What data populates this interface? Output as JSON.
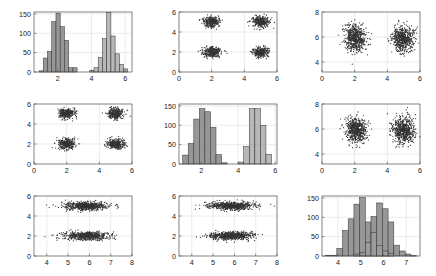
{
  "figure": {
    "name": "scatter-plot-matrix",
    "rows": 3,
    "cols": 3,
    "background": "#ffffff",
    "point_color": "#333333",
    "bar_fill_a": "#8e8e8e",
    "bar_fill_b": "#9c9c9c",
    "bar_edge": "#3c3c3c",
    "grid_color": "#d9d9d9",
    "axis_color": "#4d4d4d"
  },
  "chart_data": [
    {
      "id": "panel-1-1",
      "type": "bar",
      "subtype": "histogram",
      "title": "",
      "xlabel": "",
      "ylabel": "",
      "xlim": [
        0.6,
        6.4
      ],
      "ylim": [
        0,
        155
      ],
      "xticks": [
        2,
        4,
        6
      ],
      "xtick_labels": [
        "2",
        "4",
        "6"
      ],
      "yticks": [
        0,
        50,
        100,
        150
      ],
      "ytick_labels": [
        "0",
        "50",
        "100",
        "150"
      ],
      "grid": true,
      "bin_width": 0.25,
      "series": [
        {
          "name": "group-1",
          "bin_starts": [
            0.9,
            1.15,
            1.4,
            1.65,
            1.9,
            2.15,
            2.4,
            2.65,
            2.9
          ],
          "values": [
            3,
            36,
            53,
            130,
            152,
            117,
            82,
            11,
            11
          ]
        },
        {
          "name": "group-2",
          "bin_starts": [
            3.9,
            4.15,
            4.4,
            4.65,
            4.9,
            5.15,
            5.4,
            5.65,
            5.9
          ],
          "values": [
            4,
            11,
            37,
            86,
            154,
            93,
            47,
            20,
            8
          ]
        }
      ]
    },
    {
      "id": "panel-1-2",
      "type": "scatter",
      "title": "",
      "xlabel": "",
      "ylabel": "",
      "xlim": [
        0,
        6
      ],
      "ylim": [
        0,
        6
      ],
      "xticks": [
        0,
        2,
        4,
        6
      ],
      "xtick_labels": [
        "0",
        "2",
        "4",
        "6"
      ],
      "yticks": [
        0,
        2,
        4,
        6
      ],
      "ytick_labels": [
        "0",
        "2",
        "4",
        "6"
      ],
      "grid": true,
      "clusters": [
        {
          "name": "cluster-a",
          "cx": 2.0,
          "cy": 5.05,
          "sx": 0.26,
          "sy": 0.26,
          "n": 300
        },
        {
          "name": "cluster-b",
          "cx": 5.0,
          "cy": 5.05,
          "sx": 0.26,
          "sy": 0.26,
          "n": 300
        },
        {
          "name": "cluster-c",
          "cx": 2.0,
          "cy": 2.0,
          "sx": 0.26,
          "sy": 0.26,
          "n": 300
        },
        {
          "name": "cluster-d",
          "cx": 5.0,
          "cy": 2.0,
          "sx": 0.26,
          "sy": 0.26,
          "n": 300
        }
      ]
    },
    {
      "id": "panel-1-3",
      "type": "scatter",
      "title": "",
      "xlabel": "",
      "ylabel": "",
      "xlim": [
        0,
        6
      ],
      "ylim": [
        3.2,
        8
      ],
      "xticks": [
        0,
        2,
        4,
        6
      ],
      "xtick_labels": [
        "0",
        "2",
        "4",
        "6"
      ],
      "yticks": [
        4,
        6,
        8
      ],
      "ytick_labels": [
        "4",
        "6",
        "8"
      ],
      "grid": true,
      "clusters": [
        {
          "name": "cluster-left",
          "cx": 2.05,
          "cy": 5.92,
          "sx": 0.33,
          "sy": 0.52,
          "n": 600
        },
        {
          "name": "cluster-right",
          "cx": 4.95,
          "cy": 5.85,
          "sx": 0.33,
          "sy": 0.52,
          "n": 600
        }
      ]
    },
    {
      "id": "panel-2-1",
      "type": "scatter",
      "title": "",
      "xlabel": "",
      "ylabel": "",
      "xlim": [
        0,
        6
      ],
      "ylim": [
        0,
        6
      ],
      "xticks": [
        0,
        2,
        4,
        6
      ],
      "xtick_labels": [
        "0",
        "2",
        "4",
        "6"
      ],
      "yticks": [
        0,
        2,
        4,
        6
      ],
      "ytick_labels": [
        "0",
        "2",
        "4",
        "6"
      ],
      "grid": true,
      "clusters": [
        {
          "name": "cluster-a",
          "cx": 2.0,
          "cy": 5.05,
          "sx": 0.26,
          "sy": 0.26,
          "n": 300
        },
        {
          "name": "cluster-b",
          "cx": 5.0,
          "cy": 5.05,
          "sx": 0.26,
          "sy": 0.26,
          "n": 300
        },
        {
          "name": "cluster-c",
          "cx": 2.0,
          "cy": 2.0,
          "sx": 0.26,
          "sy": 0.26,
          "n": 300
        },
        {
          "name": "cluster-d",
          "cx": 5.0,
          "cy": 2.0,
          "sx": 0.26,
          "sy": 0.26,
          "n": 300
        }
      ]
    },
    {
      "id": "panel-2-2",
      "type": "bar",
      "subtype": "histogram",
      "title": "",
      "xlabel": "",
      "ylabel": "",
      "xlim": [
        0.8,
        6.1
      ],
      "ylim": [
        0,
        155
      ],
      "xticks": [
        2,
        4,
        6
      ],
      "xtick_labels": [
        "2",
        "4",
        "6"
      ],
      "yticks": [
        0,
        50,
        100,
        150
      ],
      "ytick_labels": [
        "0",
        "50",
        "100",
        "150"
      ],
      "grid": true,
      "bin_width": 0.3,
      "series": [
        {
          "name": "group-1",
          "bin_starts": [
            1.0,
            1.3,
            1.6,
            1.9,
            2.2,
            2.5,
            2.8,
            3.1
          ],
          "values": [
            23,
            53,
            116,
            143,
            135,
            95,
            24,
            3
          ]
        },
        {
          "name": "group-2",
          "bin_starts": [
            4.0,
            4.3,
            4.6,
            4.9,
            5.2,
            5.5
          ],
          "values": [
            5,
            45,
            143,
            143,
            100,
            25
          ]
        }
      ]
    },
    {
      "id": "panel-2-3",
      "type": "scatter",
      "title": "",
      "xlabel": "",
      "ylabel": "",
      "xlim": [
        0,
        6
      ],
      "ylim": [
        3.2,
        8
      ],
      "xticks": [
        0,
        2,
        4,
        6
      ],
      "xtick_labels": [
        "0",
        "2",
        "4",
        "6"
      ],
      "yticks": [
        4,
        6,
        8
      ],
      "ytick_labels": [
        "4",
        "6",
        "8"
      ],
      "grid": true,
      "clusters": [
        {
          "name": "cluster-left",
          "cx": 2.1,
          "cy": 5.9,
          "sx": 0.33,
          "sy": 0.52,
          "n": 600
        },
        {
          "name": "cluster-right",
          "cx": 5.0,
          "cy": 5.9,
          "sx": 0.33,
          "sy": 0.52,
          "n": 600
        }
      ]
    },
    {
      "id": "panel-3-1",
      "type": "scatter",
      "title": "",
      "xlabel": "",
      "ylabel": "",
      "xlim": [
        3.4,
        8
      ],
      "ylim": [
        0,
        6
      ],
      "xticks": [
        4,
        5,
        6,
        7,
        8
      ],
      "xtick_labels": [
        "4",
        "5",
        "6",
        "7",
        "8"
      ],
      "yticks": [
        0,
        2,
        4,
        6
      ],
      "ytick_labels": [
        "0",
        "2",
        "4",
        "6"
      ],
      "grid": true,
      "clusters": [
        {
          "name": "cluster-top",
          "cx": 5.85,
          "cy": 5.02,
          "sx": 0.53,
          "sy": 0.2,
          "n": 600
        },
        {
          "name": "cluster-bottom",
          "cx": 5.85,
          "cy": 2.02,
          "sx": 0.53,
          "sy": 0.2,
          "n": 600
        }
      ]
    },
    {
      "id": "panel-3-2",
      "type": "scatter",
      "title": "",
      "xlabel": "",
      "ylabel": "",
      "xlim": [
        3.4,
        8
      ],
      "ylim": [
        0,
        6
      ],
      "xticks": [
        4,
        5,
        6,
        7,
        8
      ],
      "xtick_labels": [
        "4",
        "5",
        "6",
        "7",
        "8"
      ],
      "yticks": [
        0,
        2,
        4,
        6
      ],
      "ytick_labels": [
        "0",
        "2",
        "4",
        "6"
      ],
      "grid": true,
      "clusters": [
        {
          "name": "cluster-top",
          "cx": 5.85,
          "cy": 5.02,
          "sx": 0.53,
          "sy": 0.2,
          "n": 600
        },
        {
          "name": "cluster-bottom",
          "cx": 5.85,
          "cy": 2.02,
          "sx": 0.53,
          "sy": 0.2,
          "n": 600
        }
      ]
    },
    {
      "id": "panel-3-3",
      "type": "bar",
      "subtype": "histogram",
      "title": "",
      "xlabel": "",
      "ylabel": "",
      "xlim": [
        3.3,
        7.6
      ],
      "ylim": [
        0,
        155
      ],
      "xticks": [
        4,
        5,
        6,
        7
      ],
      "xtick_labels": [
        "4",
        "5",
        "6",
        "7"
      ],
      "yticks": [
        0,
        50,
        100,
        150
      ],
      "ytick_labels": [
        "0",
        "50",
        "100",
        "150"
      ],
      "grid": true,
      "bin_width": 0.25,
      "series": [
        {
          "name": "group-1",
          "bin_starts": [
            3.45,
            3.7,
            3.95,
            4.2,
            4.45,
            4.7,
            4.95,
            5.2,
            5.45,
            5.7,
            5.95,
            6.2,
            6.45,
            6.7,
            6.95,
            7.2
          ],
          "values": [
            2,
            2,
            20,
            66,
            96,
            134,
            151,
            88,
            102,
            137,
            122,
            88,
            28,
            13,
            5,
            1
          ]
        },
        {
          "name": "group-2",
          "bin_starts": [
            4.7,
            4.95,
            5.2,
            5.45,
            5.7,
            5.95,
            6.2
          ],
          "values": [
            5,
            9,
            35,
            61,
            27,
            13,
            7
          ]
        }
      ]
    }
  ]
}
